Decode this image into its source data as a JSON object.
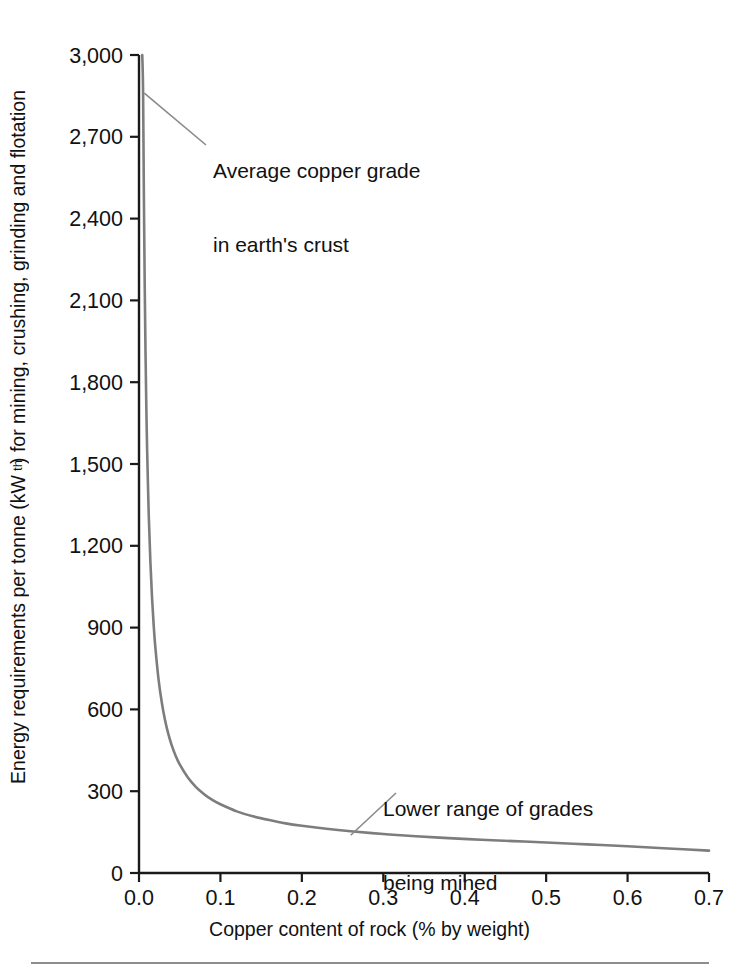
{
  "chart_data": {
    "type": "line",
    "title": "",
    "subtitle": "",
    "xlabel": "Copper content of rock (% by weight)",
    "ylabel": "Energy requirements per tonne (kWth) for mining, crushing, grinding and flotation",
    "ylabel_prefix": "Energy requirements per tonne (kW",
    "ylabel_sub": "th",
    "ylabel_suffix": ") for mining, crushing, grinding and flotation",
    "xlim": [
      0.0,
      0.7
    ],
    "ylim": [
      0,
      3000
    ],
    "xticks": [
      0.0,
      0.1,
      0.2,
      0.3,
      0.4,
      0.5,
      0.6,
      0.7
    ],
    "xtick_labels": [
      "0.0",
      "0.1",
      "0.2",
      "0.3",
      "0.4",
      "0.5",
      "0.6",
      "0.7"
    ],
    "yticks": [
      0,
      300,
      600,
      900,
      1200,
      1500,
      1800,
      2100,
      2400,
      2700,
      3000
    ],
    "ytick_labels": [
      "0",
      "300",
      "600",
      "900",
      "1,200",
      "1,500",
      "1,800",
      "2,100",
      "2,400",
      "2,700",
      "3,000"
    ],
    "grid": false,
    "legend": false,
    "series": [
      {
        "name": "Energy requirement vs ore grade",
        "color": "#7d7d7d",
        "x": [
          0.004,
          0.005,
          0.006,
          0.007,
          0.008,
          0.009,
          0.01,
          0.012,
          0.014,
          0.016,
          0.018,
          0.02,
          0.024,
          0.028,
          0.032,
          0.036,
          0.04,
          0.045,
          0.05,
          0.06,
          0.07,
          0.08,
          0.09,
          0.1,
          0.12,
          0.14,
          0.16,
          0.18,
          0.2,
          0.23,
          0.26,
          0.3,
          0.34,
          0.38,
          0.42,
          0.46,
          0.5,
          0.55,
          0.6,
          0.65,
          0.7
        ],
        "y": [
          3000,
          2870,
          2480,
          2160,
          1910,
          1710,
          1550,
          1310,
          1140,
          1010,
          910,
          830,
          710,
          625,
          560,
          510,
          470,
          430,
          398,
          350,
          315,
          289,
          268,
          252,
          226,
          208,
          194,
          182,
          173,
          162,
          153,
          143,
          135,
          128,
          122,
          117,
          112,
          105,
          98,
          90,
          82
        ]
      }
    ],
    "annotations": [
      {
        "name": "average-copper-grade",
        "text_line1": "Average copper grade",
        "text_line2": "in earth's crust",
        "points_to_x": 0.004,
        "points_to_y": 2860
      },
      {
        "name": "lower-range-of-grades",
        "text_line1": "Lower range of grades",
        "text_line2": "being mined",
        "points_to_x": 0.26,
        "points_to_y": 153
      }
    ],
    "axis_color": "#1a1a1a",
    "curve_color": "#7d7d7d",
    "background": "#ffffff"
  }
}
